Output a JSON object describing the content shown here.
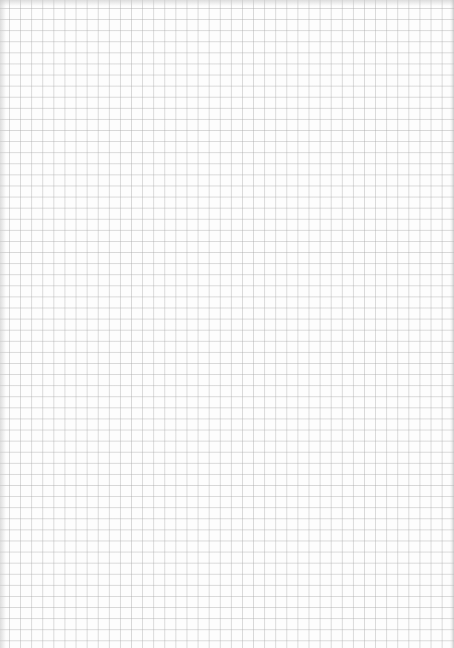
{
  "page": {
    "type": "blank-grid-paper",
    "grid_color": "#c8c8c8",
    "background_color": "#fdfdfd"
  }
}
